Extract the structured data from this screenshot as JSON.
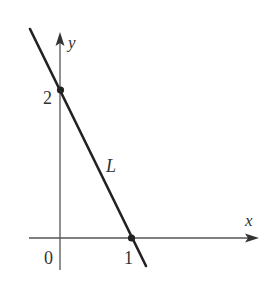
{
  "diagram": {
    "type": "coordinate-graph",
    "axes": {
      "x_label": "x",
      "y_label": "y",
      "origin_label": "0"
    },
    "line": {
      "label": "L",
      "points": [
        {
          "x": 0,
          "y": 2,
          "label": "2"
        },
        {
          "x": 1,
          "y": 0,
          "label": "1"
        }
      ]
    },
    "colors": {
      "axis": "#555555",
      "line": "#222222",
      "text": "#333333"
    }
  }
}
